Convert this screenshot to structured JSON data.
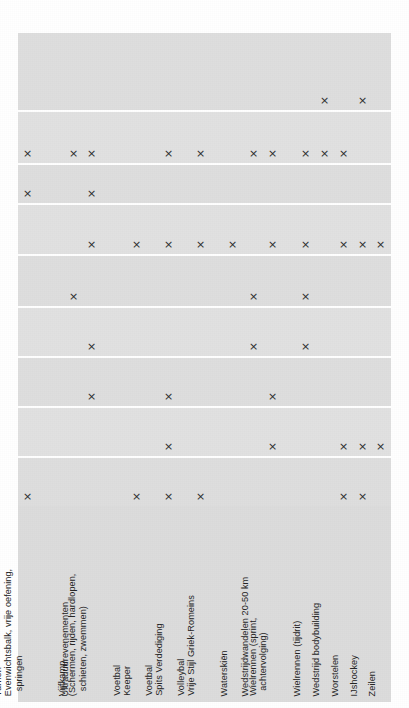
{
  "figure": {
    "type": "matrix",
    "background_color": "#ffffff",
    "panel_color": "#dedede",
    "label_panel_color": "#dcdcdc",
    "divider_color": "#ffffff",
    "mark_color": "#2e2e2e",
    "mark_glyph": "×"
  },
  "chart_data": {
    "type": "heatmap",
    "title": "",
    "subtitle": "",
    "xlabel": "",
    "ylabel": "",
    "grid": true,
    "legend_position": "none",
    "mark_symbol": "×",
    "note": "Binary presence matrix: each × marks a sport/discipline (column) belonging to a row category. 18 columns × 9 rows.",
    "categories": [
      "Turnen Evenwichtsbalk, vrije oefening, springen",
      "Ultraduurevenementen",
      "Vijfkamp (Schermen, rijden, hardlopen, schieten, zwemmen)",
      "Voetbal Keeper",
      "Voetbal Spits Verdediging",
      "Volleybal",
      "Vrije Stijl Griek-Romeins",
      "Waterskiën",
      "Wedstrijdwandelen 20-50 km",
      "Wielrennen (sprint, achtervolging)",
      "Wielrennen (tijdrit)",
      "Wedstrijd bodybuilding",
      "Worstelen",
      "IJshockey",
      "Zeilen"
    ],
    "columns": [
      {
        "index": 0,
        "x": 27,
        "label_lines": [
          "Turnen",
          "Evenwichtsbalk, vrije oefening,",
          "springen"
        ],
        "indent": [
          false,
          false,
          true
        ]
      },
      {
        "index": 1,
        "x": 46,
        "label_lines": [],
        "indent": []
      },
      {
        "index": 2,
        "x": 73,
        "label_lines": [
          "Ultraduurevenementen"
        ],
        "indent": [
          false
        ]
      },
      {
        "index": 3,
        "x": 91,
        "label_lines": [
          "Vijfkamp",
          "(Schermen, rijden, hardlopen,",
          "schieten, zwemmen)"
        ],
        "indent": [
          false,
          false,
          true
        ]
      },
      {
        "index": 4,
        "x": 110,
        "label_lines": [],
        "indent": []
      },
      {
        "index": 5,
        "x": 136,
        "label_lines": [
          "Voetbal",
          "Keeper"
        ],
        "indent": [
          false,
          false
        ]
      },
      {
        "index": 6,
        "x": 168,
        "label_lines": [
          "Voetbal",
          "Spits Verdediging"
        ],
        "indent": [
          false,
          false
        ]
      },
      {
        "index": 7,
        "x": 200,
        "label_lines": [
          "Volleybal",
          "Vrije Stijl Griek-Romeins"
        ],
        "indent": [
          false,
          false
        ]
      },
      {
        "index": 8,
        "x": 232,
        "label_lines": [
          "Waterskiën"
        ],
        "indent": [
          false
        ]
      },
      {
        "index": 9,
        "x": 253,
        "label_lines": [
          "Wedstrijdwandelen 20-50 km"
        ],
        "indent": [
          false
        ]
      },
      {
        "index": 10,
        "x": 272,
        "label_lines": [
          "Wielrennen (sprint,",
          "achtervolging)"
        ],
        "indent": [
          false,
          true
        ]
      },
      {
        "index": 11,
        "x": 305,
        "label_lines": [
          "Wielrennen (tijdrit)"
        ],
        "indent": [
          false
        ]
      },
      {
        "index": 12,
        "x": 324,
        "label_lines": [
          "Wedstrijd bodybuilding"
        ],
        "indent": [
          false
        ]
      },
      {
        "index": 13,
        "x": 343,
        "label_lines": [
          "Worstelen"
        ],
        "indent": [
          false
        ]
      },
      {
        "index": 14,
        "x": 362,
        "label_lines": [
          "IJshockey"
        ],
        "indent": [
          false
        ]
      },
      {
        "index": 15,
        "x": 380,
        "label_lines": [
          "Zeilen"
        ],
        "indent": [
          false
        ]
      }
    ],
    "rows": [
      {
        "index": 0,
        "top": 0,
        "height": 77,
        "marks_x": [
          324,
          362
        ]
      },
      {
        "index": 1,
        "top": 79,
        "height": 51,
        "marks_x": [
          27,
          73,
          91,
          168,
          200,
          253,
          272,
          305,
          324,
          343
        ]
      },
      {
        "index": 2,
        "top": 132,
        "height": 38,
        "marks_x": [
          27,
          91
        ]
      },
      {
        "index": 3,
        "top": 172,
        "height": 49,
        "marks_x": [
          91,
          136,
          168,
          200,
          232,
          272,
          305,
          343,
          362,
          380
        ]
      },
      {
        "index": 4,
        "top": 223,
        "height": 50,
        "marks_x": [
          73,
          253,
          305
        ]
      },
      {
        "index": 5,
        "top": 275,
        "height": 48,
        "marks_x": [
          91,
          253,
          305
        ]
      },
      {
        "index": 6,
        "top": 325,
        "height": 48,
        "marks_x": [
          91,
          168,
          272
        ]
      },
      {
        "index": 7,
        "top": 375,
        "height": 48,
        "marks_x": [
          168,
          272,
          343,
          362,
          380
        ]
      },
      {
        "index": 8,
        "top": 425,
        "height": 48,
        "marks_x": [
          27,
          136,
          168,
          200,
          343,
          362
        ]
      }
    ],
    "row_count": 9,
    "column_count": 16,
    "total_marks": 45
  }
}
